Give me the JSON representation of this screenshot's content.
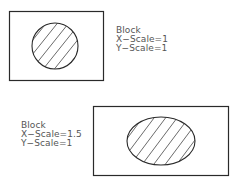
{
  "colors": {
    "stroke": "#2a2a2a",
    "hatch": "#444444",
    "text": "#555555"
  },
  "top_example": {
    "title": "Block",
    "x_scale": "X−Scale=1",
    "y_scale": "Y−Scale=1",
    "shape": "circle"
  },
  "bottom_example": {
    "title": "Block",
    "x_scale": "X−Scale=1.5",
    "y_scale": "Y−Scale=1",
    "shape": "ellipse"
  }
}
